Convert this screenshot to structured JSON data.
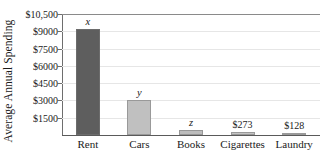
{
  "chart_data": {
    "type": "bar",
    "title": "",
    "xlabel": "",
    "ylabel": "Average Annual Spending",
    "categories": [
      "Rent",
      "Cars",
      "Books",
      "Cigarettes",
      "Laundry"
    ],
    "values": [
      9200,
      3000,
      420,
      273,
      128
    ],
    "data_labels": [
      "x",
      "y",
      "z",
      "$273",
      "$128"
    ],
    "data_label_kinds": [
      "variable",
      "variable",
      "variable",
      "value",
      "value"
    ],
    "ylim": [
      0,
      10500
    ],
    "yticks": [
      1500,
      3000,
      4500,
      6000,
      7500,
      9000,
      10500
    ],
    "ytick_labels": [
      "$1500",
      "$3000",
      "$4500",
      "$6000",
      "$7500",
      "$9000",
      "$10,500"
    ],
    "grid": true,
    "legend": "none",
    "bar_colors": [
      "#5e5e5e",
      "#c0c0c0",
      "#bdbdbd",
      "#c4c4c4",
      "#c4c4c4"
    ]
  },
  "colors": {
    "axis": "#5a5a5a",
    "gridline": "#e6e6e6",
    "text": "#1a1a1a",
    "bar_dark": "#5e5e5e",
    "bar_light": "#c0c0c0"
  }
}
